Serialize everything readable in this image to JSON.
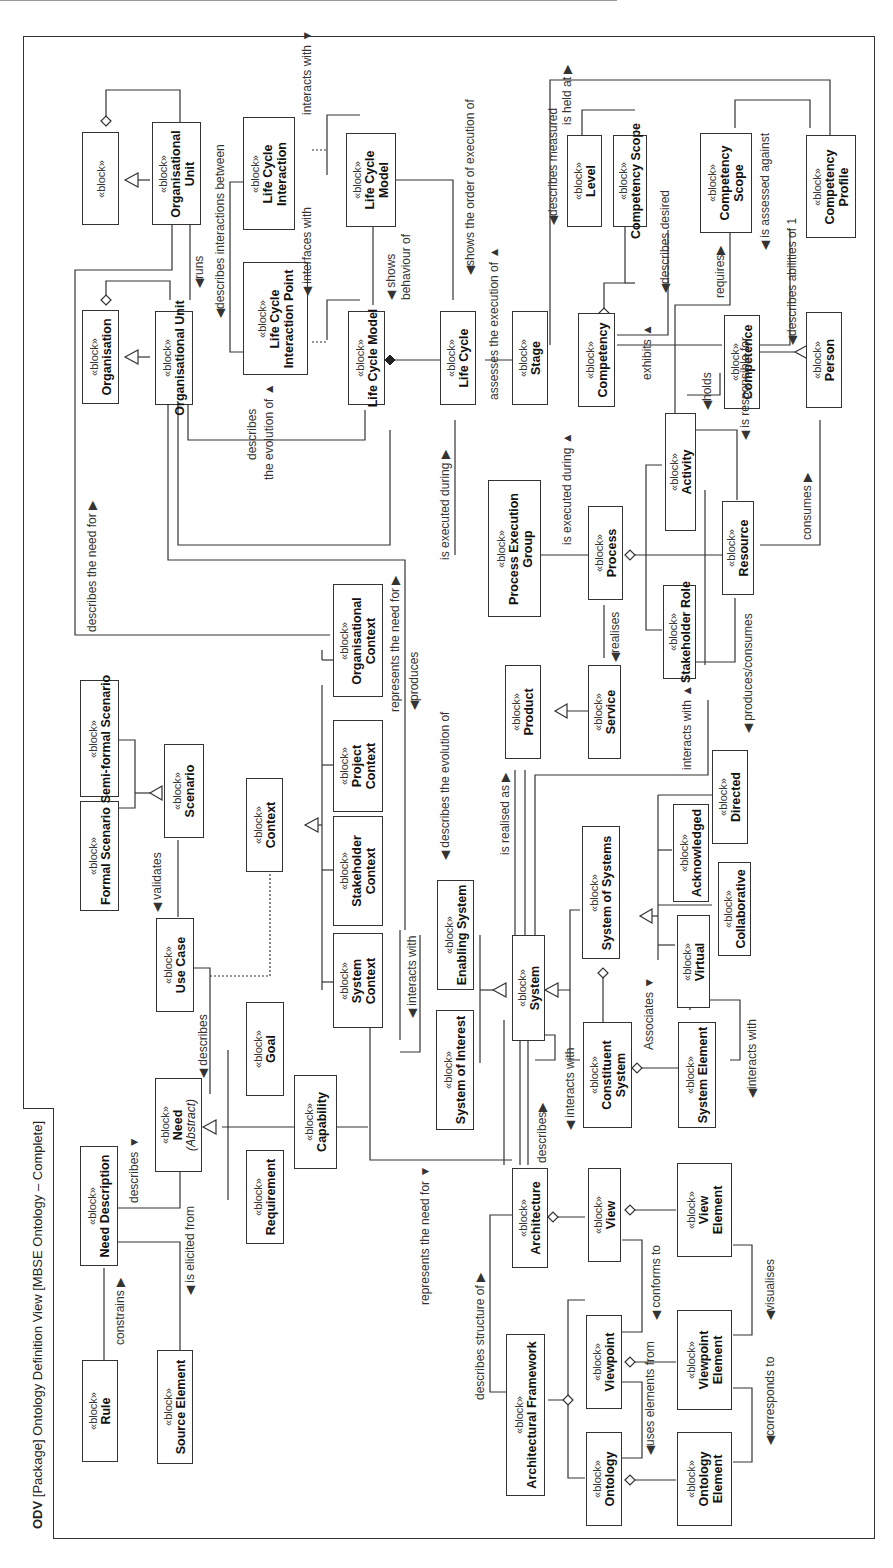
{
  "diagram": {
    "title": {
      "kind": "ODV",
      "rest": "[Package] Ontology Definition View [MBSE Ontology – Complete]"
    },
    "orientation": "rotated 90° counter-clockwise",
    "stereotype": "«block»",
    "blocks": [
      {
        "id": "rule",
        "name": "Rule"
      },
      {
        "id": "need_description",
        "name": "Need Description"
      },
      {
        "id": "source_element",
        "name": "Source Element"
      },
      {
        "id": "need",
        "name": "Need",
        "note": "(Abstract)"
      },
      {
        "id": "requirement",
        "name": "Requirement"
      },
      {
        "id": "capability",
        "name": "Capability"
      },
      {
        "id": "goal",
        "name": "Goal"
      },
      {
        "id": "use_case",
        "name": "Use Case"
      },
      {
        "id": "formal_scenario",
        "name": "Formal Scenario"
      },
      {
        "id": "semi_formal_scenario",
        "name": "Semi-formal Scenario"
      },
      {
        "id": "scenario",
        "name": "Scenario"
      },
      {
        "id": "context",
        "name": "Context"
      },
      {
        "id": "system_context",
        "name": "System Context"
      },
      {
        "id": "stakeholder_context",
        "name": "Stakeholder Context"
      },
      {
        "id": "project_context",
        "name": "Project Context"
      },
      {
        "id": "organisational_context",
        "name": "Organisational Context"
      },
      {
        "id": "architectural_framework",
        "name": "Architectural Framework"
      },
      {
        "id": "architecture",
        "name": "Architecture"
      },
      {
        "id": "ontology",
        "name": "Ontology"
      },
      {
        "id": "viewpoint",
        "name": "Viewpoint"
      },
      {
        "id": "view",
        "name": "View"
      },
      {
        "id": "ontology_element",
        "name": "Ontology Element"
      },
      {
        "id": "viewpoint_element",
        "name": "Viewpoint Element"
      },
      {
        "id": "view_element",
        "name": "View Element"
      },
      {
        "id": "system_of_interest",
        "name": "System of Interest"
      },
      {
        "id": "enabling_system",
        "name": "Enabling System"
      },
      {
        "id": "system",
        "name": "System"
      },
      {
        "id": "constituent_system",
        "name": "Constituent System"
      },
      {
        "id": "system_element",
        "name": "System Element"
      },
      {
        "id": "system_of_systems",
        "name": "System of Systems"
      },
      {
        "id": "virtual",
        "name": "Virtual"
      },
      {
        "id": "collaborative",
        "name": "Collaborative"
      },
      {
        "id": "acknowledged",
        "name": "Acknowledged"
      },
      {
        "id": "directed",
        "name": "Directed"
      },
      {
        "id": "product",
        "name": "Product"
      },
      {
        "id": "service",
        "name": "Service"
      },
      {
        "id": "process_execution_group",
        "name": "Process Execution Group"
      },
      {
        "id": "process",
        "name": "Process"
      },
      {
        "id": "artefact",
        "name": "Artefact"
      },
      {
        "id": "stakeholder_role",
        "name": "Stakeholder Role"
      },
      {
        "id": "activity",
        "name": "Activity"
      },
      {
        "id": "resource",
        "name": "Resource"
      },
      {
        "id": "person",
        "name": "Person"
      },
      {
        "id": "competence",
        "name": "Competence"
      },
      {
        "id": "competency",
        "name": "Competency"
      },
      {
        "id": "level",
        "name": "Level"
      },
      {
        "id": "competency_scope",
        "name": "Competency Scope"
      },
      {
        "id": "competency_profile",
        "name": "Competency Profile"
      },
      {
        "id": "gate",
        "name": "Gate"
      },
      {
        "id": "stage",
        "name": "Stage"
      },
      {
        "id": "life_cycle",
        "name": "Life Cycle"
      },
      {
        "id": "life_cycle_model",
        "name": "Life Cycle Model"
      },
      {
        "id": "life_cycle_interaction_point",
        "name": "Life Cycle Interaction Point"
      },
      {
        "id": "life_cycle_interaction",
        "name": "Life Cycle Interaction"
      },
      {
        "id": "programme",
        "name": "Programme"
      },
      {
        "id": "project",
        "name": "Project"
      },
      {
        "id": "organisation",
        "name": "Organisation"
      },
      {
        "id": "organisational_unit",
        "name": "Organisational Unit"
      }
    ],
    "relationship_labels": {
      "constrains": "constrains ▶",
      "is_elicited_from": "◀ is elicited from",
      "describes_need": "describes ▼",
      "describes_uc": "◀ describes",
      "validates": "◀ validates",
      "represents_need_for_sys": "represents the need for ▼",
      "describes_structure_of": "describes structure of ▶",
      "describes_arch": "describes▶",
      "interacts_with_sys": "◀ interacts with",
      "interacts_with_soi": "◀ interacts with",
      "uses_elements_from": "◀uses elements from",
      "conforms_to": "◀ conforms to",
      "corresponds_to": "◀corresponds to",
      "visualises": "◀visualises",
      "associates": "Associates ▼",
      "interacts_with_se": "◀interacts with",
      "is_realised_as": "is realised as ▶",
      "interacts_with_svc": "interacts with ▲",
      "produces_consumes": "◀ produces/consumes",
      "realises": "◀realises",
      "is_executed_during_peg": "is executed during ▶",
      "is_executed_during_proc": "is executed during ▲",
      "describes_evolution_lc": "◀ describes the evolution of",
      "describes_evolution_proj_1": "describes",
      "describes_evolution_proj_2": "the evolution of ▲",
      "describes_need_for_proj": "describes the need for ▶",
      "represents_need_for_org": "represents the need for ▶",
      "produces": "◀produces",
      "runs": "◀runs",
      "describes_interactions_between": "◀describes interactions between",
      "interfaces_with": "◀ interfaces with",
      "interacts_with_lci": "interacts with ▼",
      "shows_behaviour_1": "◀ shows",
      "shows_behaviour_2": "behaviour of",
      "shows_order": "◀shows the order of execution of",
      "assesses_execution": "assesses the execution of ▲",
      "describes_measured": "◀describes measured",
      "is_held_at": "is held at ▶",
      "describes_desired": "◀describes desired",
      "requires": "requires▶",
      "is_assessed_against": "◀ is assessed against",
      "describes_abilities": "◀describes abilities of 1",
      "exhibits": "exhibits ▲",
      "holds": "◀holds",
      "is_responsible_for": "◀ is responsible for",
      "consumes": "consumes ▶"
    }
  }
}
